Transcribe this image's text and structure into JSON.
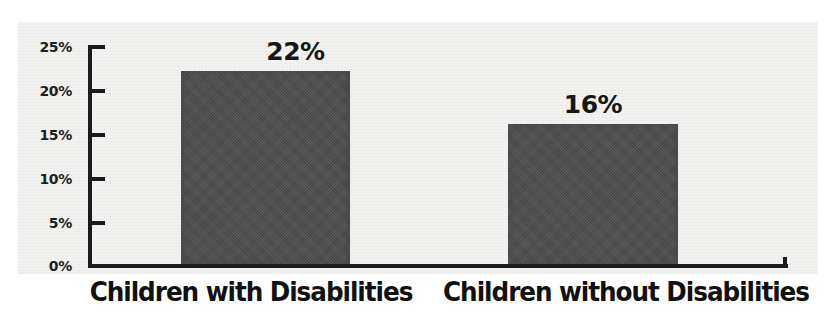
{
  "chart_data": {
    "type": "bar",
    "title": "",
    "subtitle": "",
    "xlabel": "",
    "ylabel": "",
    "categories": [
      "Children with Disabilities",
      "Children without Disabilities"
    ],
    "values": [
      22,
      16
    ],
    "value_labels": [
      "22%",
      "16%"
    ],
    "ylim": [
      0,
      25
    ],
    "y_ticks": [
      0,
      5,
      10,
      15,
      20,
      25
    ],
    "y_tick_labels": [
      "0%",
      "5%",
      "10%",
      "15%",
      "20%",
      "25%"
    ],
    "grid": false,
    "legend": false,
    "legend_position": "none",
    "colors": {
      "bar_fill": "#4b4b4b",
      "axis": "#1a1a1a",
      "text": "#111111",
      "plot_background": "#f3f3f1",
      "page_background": "#ffffff"
    }
  },
  "axis": {
    "y_tick_labels": [
      "25%",
      "20%",
      "15%",
      "10%",
      "5%",
      "0%"
    ]
  },
  "bars": [
    {
      "label": "Children with Disabilities",
      "value_label": "22%"
    },
    {
      "label": "Children without Disabilities",
      "value_label": "16%"
    }
  ]
}
